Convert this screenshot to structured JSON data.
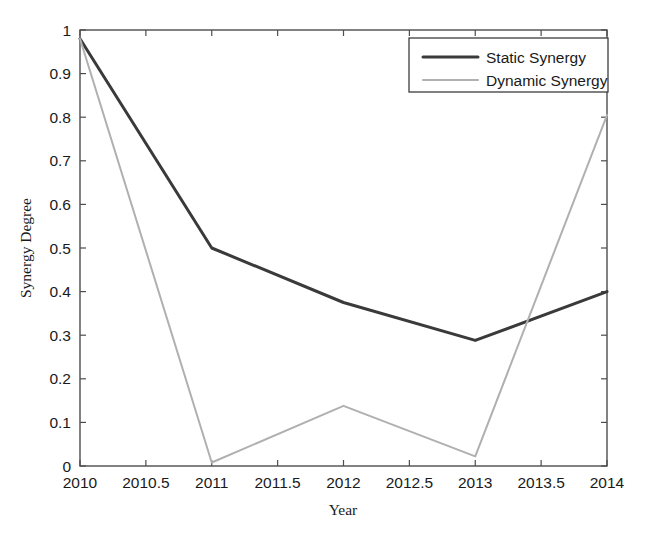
{
  "chart_data": {
    "type": "line",
    "title": "",
    "xlabel": "Year",
    "ylabel": "Synergy Degree",
    "xlim": [
      2010,
      2014
    ],
    "ylim": [
      0,
      1
    ],
    "grid": false,
    "legend_position": "top-right",
    "x": [
      2010,
      2011,
      2012,
      2013,
      2014
    ],
    "xticks": [
      "2010",
      "2010.5",
      "2011",
      "2011.5",
      "2012",
      "2012.5",
      "2013",
      "2013.5",
      "2014"
    ],
    "xtick_values": [
      2010,
      2010.5,
      2011,
      2011.5,
      2012,
      2012.5,
      2013,
      2013.5,
      2014
    ],
    "yticks": [
      "0",
      "0.1",
      "0.2",
      "0.3",
      "0.4",
      "0.5",
      "0.6",
      "0.7",
      "0.8",
      "0.9",
      "1"
    ],
    "ytick_values": [
      0,
      0.1,
      0.2,
      0.3,
      0.4,
      0.5,
      0.6,
      0.7,
      0.8,
      0.9,
      1
    ],
    "series": [
      {
        "name": "Static Synergy",
        "color": "#3a3a3a",
        "linewidth": 3.0,
        "values": [
          0.98,
          0.5,
          0.375,
          0.288,
          0.4
        ]
      },
      {
        "name": "Dynamic Synergy",
        "color": "#b0b0b0",
        "linewidth": 2.0,
        "values": [
          0.98,
          0.008,
          0.138,
          0.022,
          0.805
        ]
      }
    ]
  },
  "legend": {
    "entries": [
      {
        "label": "Static Synergy"
      },
      {
        "label": "Dynamic Synergy"
      }
    ]
  },
  "axes": {
    "x_title": "Year",
    "y_title": "Synergy Degree"
  }
}
